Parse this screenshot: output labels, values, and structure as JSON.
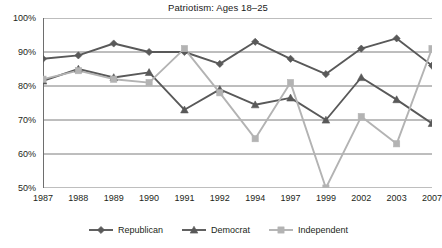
{
  "chart_data": {
    "type": "line",
    "title": "Patriotism: Ages 18–25",
    "xlabel": "",
    "ylabel": "",
    "categories": [
      "1987",
      "1988",
      "1989",
      "1990",
      "1991",
      "1992",
      "1994",
      "1997",
      "1999",
      "2002",
      "2003",
      "2007"
    ],
    "ylim": [
      50,
      100
    ],
    "yticks": [
      50,
      60,
      70,
      80,
      90,
      100
    ],
    "ytick_labels": [
      "50%",
      "60%",
      "70%",
      "80%",
      "90%",
      "100%"
    ],
    "grid": true,
    "legend_position": "bottom",
    "series": [
      {
        "name": "Republican",
        "color": "#595959",
        "marker": "diamond",
        "values": [
          88,
          89,
          92.5,
          90,
          90,
          86.5,
          93,
          88,
          83.5,
          91,
          94,
          86
        ]
      },
      {
        "name": "Democrat",
        "color": "#595959",
        "marker": "triangle",
        "values": [
          81.5,
          85,
          82.5,
          84,
          73,
          79,
          74.5,
          76.5,
          70,
          82.5,
          76,
          69
        ]
      },
      {
        "name": "Independent",
        "color": "#b3b3b3",
        "marker": "square",
        "values": [
          82,
          84.5,
          82,
          81,
          91,
          78,
          64.5,
          81,
          50,
          71,
          63,
          91
        ]
      }
    ]
  },
  "legend": {
    "items": [
      {
        "label": "Republican",
        "marker": "diamond-marker-icon"
      },
      {
        "label": "Democrat",
        "marker": "triangle-marker-icon"
      },
      {
        "label": "Independent",
        "marker": "square-marker-icon"
      }
    ]
  }
}
